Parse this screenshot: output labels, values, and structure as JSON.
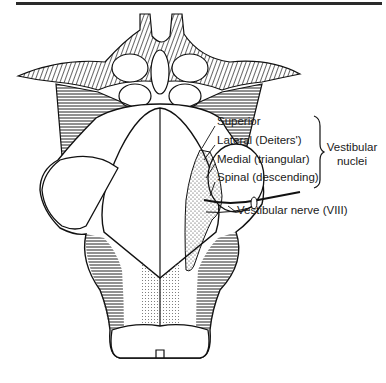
{
  "figure": {
    "labels": [
      {
        "id": "superior",
        "text": "Superior"
      },
      {
        "id": "lateral",
        "text": "Lateral (Deiters')"
      },
      {
        "id": "medial",
        "text": "Medial (triangular)"
      },
      {
        "id": "spinal",
        "text": "Spinal (descending)"
      },
      {
        "id": "nerve",
        "text": "Vestibular nerve (VIII)"
      }
    ],
    "group_label": {
      "line1": "Vestibular",
      "line2": "nuclei"
    },
    "colors": {
      "ink": "#1a1a1a",
      "background": "#ffffff"
    }
  }
}
